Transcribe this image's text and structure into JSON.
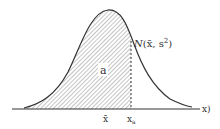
{
  "diagram": {
    "type": "normal-distribution-shaded-area",
    "distribution_label_N": "N",
    "distribution_label_rest": "(x̄, s",
    "distribution_label_sup": "2",
    "distribution_label_close": ")",
    "area_label": "a",
    "axis_label": "x)",
    "tick_labels": {
      "mean": "x̄",
      "threshold": "x",
      "threshold_sub": "a"
    },
    "colors": {
      "curve": "#333333",
      "hatch": "#888888",
      "background": "#ffffff"
    }
  }
}
